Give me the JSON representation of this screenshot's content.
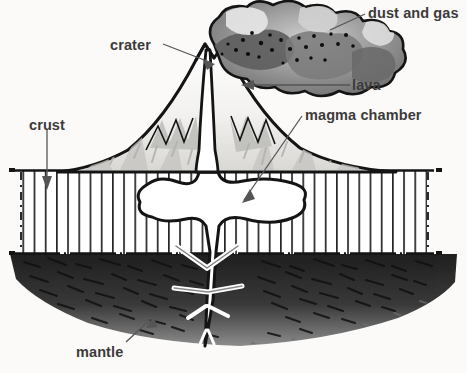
{
  "diagram": {
    "style": "black-and-white pen-and-ink illustration",
    "palette": {
      "background": "#fbfaf8",
      "ink": "#1a1a1a",
      "label_text": "#3b3b3b",
      "leader_line": "#555555",
      "cloud_dark": "#6f6f6f",
      "cloud_mid": "#9a9a9a",
      "cloud_light": "#cfcfcf",
      "cone_shade": "#b9b9b9",
      "crust_hatch": "#2a2a2a",
      "mantle_dark": "#2b2b2b",
      "mantle_mid": "#5a5a5a",
      "magma_fill": "#ffffff"
    }
  },
  "labels": {
    "dust_and_gas": "dust and gas",
    "crater": "crater",
    "lava": "lava",
    "magma_chamber": "magma chamber",
    "crust": "crust",
    "mantle": "mantle"
  },
  "parts": [
    {
      "id": "dust-and-gas",
      "label": "dust and gas",
      "description": "billowing ash cloud above the summit"
    },
    {
      "id": "crater",
      "label": "crater",
      "description": "notch at the summit between twin peaks"
    },
    {
      "id": "lava",
      "label": "lava",
      "description": "molten rock on the upper cone slope"
    },
    {
      "id": "magma-chamber",
      "label": "magma chamber",
      "description": "white reservoir inside the crust layer"
    },
    {
      "id": "crust",
      "label": "crust",
      "description": "vertically hatched rock layer beneath the surface"
    },
    {
      "id": "mantle",
      "label": "mantle",
      "description": "dark stippled layer below the crust"
    }
  ]
}
